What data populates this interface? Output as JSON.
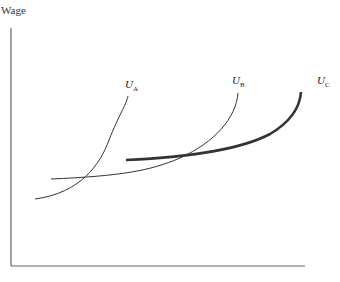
{
  "diagram": {
    "y_axis_label": "Wage",
    "curves": [
      {
        "id": "UA",
        "label": "U",
        "subscript": "A",
        "weight": "thin"
      },
      {
        "id": "UB",
        "label": "U",
        "subscript": "B",
        "weight": "thin"
      },
      {
        "id": "UC",
        "label": "U",
        "subscript": "C",
        "weight": "thick"
      }
    ],
    "colors": {
      "axis": "#666666",
      "curve": "#333333",
      "thick_curve": "#333333"
    }
  }
}
